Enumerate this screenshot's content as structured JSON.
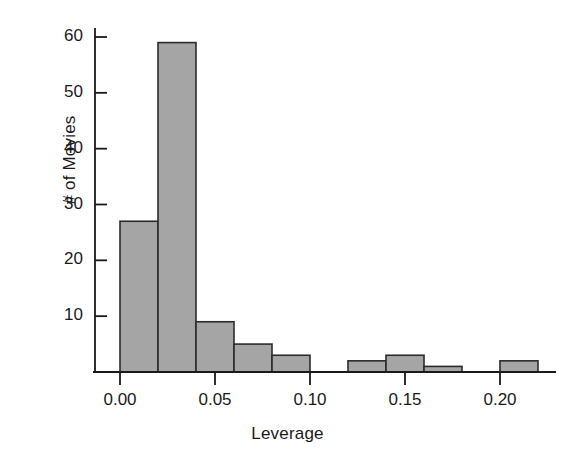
{
  "chart_data": {
    "type": "bar",
    "title": "",
    "xlabel": "Leverage",
    "ylabel": "# of Movies",
    "bin_width": 0.02,
    "xlim": [
      -0.008,
      0.232
    ],
    "ylim": [
      0,
      63
    ],
    "grid": false,
    "legend": null,
    "bar_color": "#a5a5a5",
    "bar_edge_color": "#2b2b2b",
    "axis_color": "#1a1a1a",
    "background_color": "#ffffff",
    "xticks": [
      0.0,
      0.05,
      0.1,
      0.15,
      0.2
    ],
    "xtick_labels": [
      "0.00",
      "0.05",
      "0.10",
      "0.15",
      "0.20"
    ],
    "yticks": [
      10,
      20,
      30,
      40,
      50,
      60
    ],
    "ytick_labels": [
      "10",
      "20",
      "30",
      "40",
      "50",
      "60"
    ],
    "bins": [
      {
        "x0": 0.0,
        "x1": 0.02,
        "count": 27
      },
      {
        "x0": 0.02,
        "x1": 0.04,
        "count": 59
      },
      {
        "x0": 0.04,
        "x1": 0.06,
        "count": 9
      },
      {
        "x0": 0.06,
        "x1": 0.08,
        "count": 5
      },
      {
        "x0": 0.08,
        "x1": 0.1,
        "count": 3
      },
      {
        "x0": 0.1,
        "x1": 0.12,
        "count": 0
      },
      {
        "x0": 0.12,
        "x1": 0.14,
        "count": 2
      },
      {
        "x0": 0.14,
        "x1": 0.16,
        "count": 3
      },
      {
        "x0": 0.16,
        "x1": 0.18,
        "count": 1
      },
      {
        "x0": 0.18,
        "x1": 0.2,
        "count": 0
      },
      {
        "x0": 0.2,
        "x1": 0.22,
        "count": 2
      }
    ],
    "categories": [
      "0.00-0.02",
      "0.02-0.04",
      "0.04-0.06",
      "0.06-0.08",
      "0.08-0.10",
      "0.10-0.12",
      "0.12-0.14",
      "0.14-0.16",
      "0.16-0.18",
      "0.18-0.20",
      "0.20-0.22"
    ],
    "values": [
      27,
      59,
      9,
      5,
      3,
      0,
      2,
      3,
      1,
      0,
      2
    ]
  }
}
